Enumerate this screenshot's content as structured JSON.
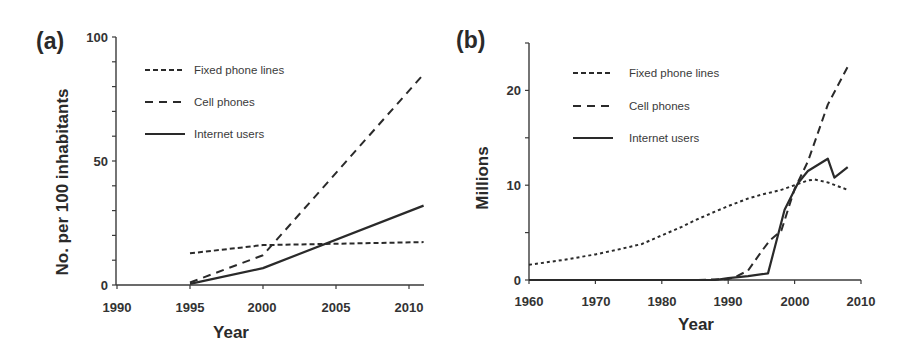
{
  "chart_data": [
    {
      "panel": "(a)",
      "type": "line",
      "title": "",
      "xlabel": "Year",
      "ylabel": "No. per 100 inhabitants",
      "xlim": [
        1990,
        2011
      ],
      "ylim": [
        0,
        100
      ],
      "xticks": [
        1990,
        1995,
        2000,
        2005,
        2010
      ],
      "yticks": [
        0,
        50,
        100
      ],
      "y_minor_step": 10,
      "grid": false,
      "legend_position": "upper-left",
      "series": [
        {
          "name": "Fixed phone lines",
          "style": "short-dash",
          "x": [
            1995,
            2000,
            2011
          ],
          "values": [
            12.8,
            16.1,
            17.3
          ]
        },
        {
          "name": "Cell phones",
          "style": "long-dash",
          "x": [
            1995,
            2000,
            2011
          ],
          "values": [
            1,
            12,
            85
          ]
        },
        {
          "name": "Internet users",
          "style": "solid",
          "x": [
            1995,
            2000,
            2011
          ],
          "values": [
            0.5,
            6.8,
            32
          ]
        }
      ]
    },
    {
      "panel": "(b)",
      "type": "line",
      "title": "",
      "xlabel": "Year",
      "ylabel": "Millions",
      "xlim": [
        1960,
        2010
      ],
      "ylim": [
        0,
        25
      ],
      "xticks": [
        1960,
        1970,
        1980,
        1990,
        2000,
        2010
      ],
      "yticks": [
        0,
        10,
        20
      ],
      "y_minor_step": 5,
      "grid": false,
      "legend_position": "upper-left",
      "series": [
        {
          "name": "Fixed phone lines",
          "style": "short-dash",
          "x": [
            1960,
            1965,
            1970,
            1974,
            1977,
            1980,
            1983,
            1985,
            1988,
            1990,
            1993,
            1995,
            1998,
            2000,
            2002,
            2003,
            2005,
            2008
          ],
          "values": [
            1.6,
            2.1,
            2.7,
            3.3,
            3.8,
            4.7,
            5.6,
            6.3,
            7.2,
            7.8,
            8.6,
            9.0,
            9.5,
            10.0,
            10.5,
            10.6,
            10.3,
            9.5
          ]
        },
        {
          "name": "Cell phones",
          "style": "long-dash",
          "x": [
            1960,
            1985,
            1990,
            1991,
            1993,
            1995,
            1996.3,
            1998,
            2000,
            2002,
            2005,
            2008
          ],
          "values": [
            0,
            0,
            0.1,
            0.3,
            1.0,
            3.0,
            4.2,
            5.2,
            9.6,
            12.5,
            18.5,
            22.5
          ]
        },
        {
          "name": "Internet users",
          "style": "solid",
          "x": [
            1960,
            1988,
            1990,
            1993,
            1996,
            1998.5,
            2000.5,
            2002,
            2005,
            2006,
            2008
          ],
          "values": [
            0,
            0,
            0.2,
            0.4,
            0.7,
            7.4,
            10.2,
            11.5,
            12.8,
            10.8,
            11.9
          ]
        }
      ]
    }
  ],
  "panels": {
    "a": {
      "label": "(a)",
      "ylabel": "No. per 100 inhabitants",
      "xlabel": "Year",
      "xtick_labels": [
        "1990",
        "1995",
        "2000",
        "2005",
        "2010"
      ],
      "ytick_labels": [
        "0",
        "50",
        "100"
      ],
      "legend": [
        "Fixed phone lines",
        "Cell phones",
        "Internet users"
      ]
    },
    "b": {
      "label": "(b)",
      "ylabel": "Millions",
      "xlabel": "Year",
      "xtick_labels": [
        "1960",
        "1970",
        "1980",
        "1990",
        "2000",
        "2010"
      ],
      "ytick_labels": [
        "0",
        "10",
        "20"
      ],
      "legend": [
        "Fixed phone lines",
        "Cell phones",
        "Internet users"
      ]
    }
  },
  "colors": {
    "line": "#2a2a2a",
    "axis": "#3a3a3a",
    "background": "#ffffff"
  }
}
